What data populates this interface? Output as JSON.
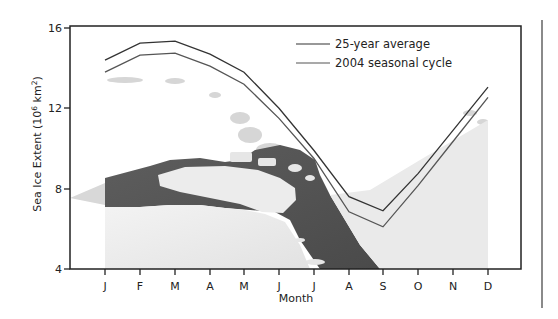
{
  "chart_data": {
    "type": "line",
    "title": "",
    "xlabel": "Month",
    "ylabel": "Sea Ice Extent (10⁶ km²)",
    "ylabel_parts": {
      "main": "Sea Ice Extent (10",
      "sup1": "6",
      "mid": " km",
      "sup2": "2",
      "end": ")"
    },
    "categories": [
      "J",
      "F",
      "M",
      "A",
      "M",
      "J",
      "J",
      "A",
      "S",
      "O",
      "N",
      "D"
    ],
    "yticks": [
      4,
      8,
      12,
      16
    ],
    "ylim": [
      4,
      16
    ],
    "grid": false,
    "legend_position": "upper right",
    "series": [
      {
        "name": "25-year average",
        "color": "#333333",
        "values": [
          14.4,
          15.25,
          15.35,
          14.7,
          13.8,
          12.0,
          9.9,
          7.6,
          6.9,
          8.75,
          10.9,
          13.05
        ]
      },
      {
        "name": "2004 seasonal cycle",
        "color": "#555555",
        "values": [
          13.8,
          14.65,
          14.75,
          14.1,
          13.2,
          11.5,
          9.5,
          6.85,
          6.1,
          8.15,
          10.35,
          12.55
        ]
      }
    ],
    "background": "grayscale photograph of sea ice floes and open water"
  },
  "legend": {
    "items": [
      "25-year average",
      "2004 seasonal cycle"
    ]
  }
}
